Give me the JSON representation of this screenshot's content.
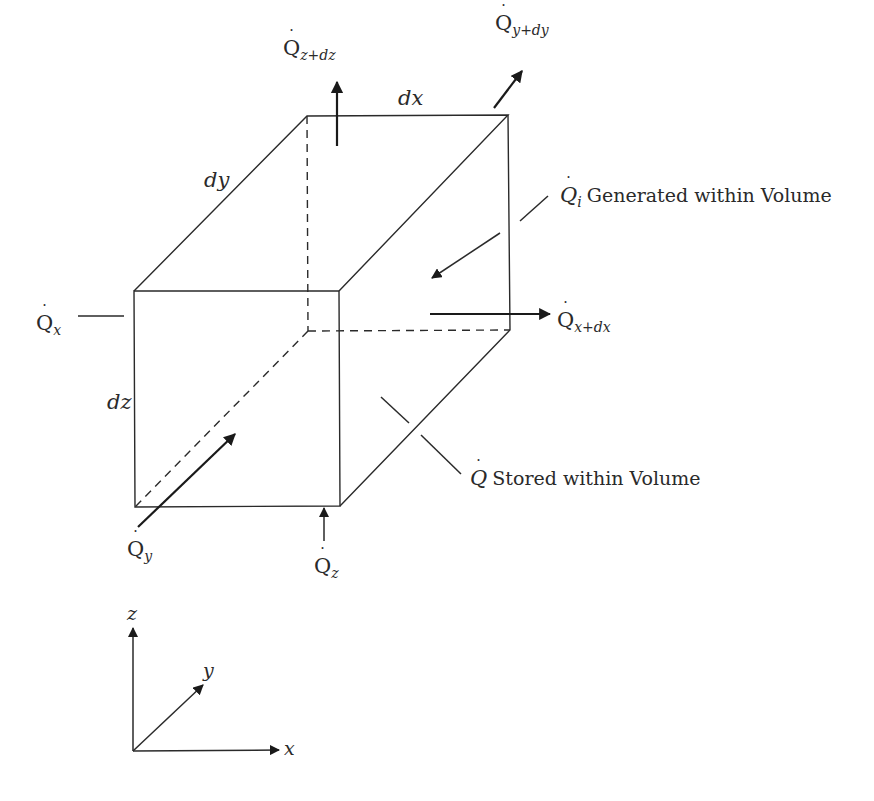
{
  "figure": {
    "type": "control-volume energy balance",
    "dimensions": {
      "dx": "dx",
      "dy": "dy",
      "dz": "dz"
    },
    "flows": {
      "qx": {
        "symbol": "Q",
        "sub": "x"
      },
      "qxdx": {
        "symbol": "Q",
        "sub": "x+dx"
      },
      "qy": {
        "symbol": "Q",
        "sub": "y"
      },
      "qydy": {
        "symbol": "Q",
        "sub": "y+dy"
      },
      "qz": {
        "symbol": "Q",
        "sub": "z"
      },
      "qzdz": {
        "symbol": "Q",
        "sub": "z+dz"
      },
      "qi": {
        "symbol": "Q",
        "sub": "i",
        "text": "Generated within Volume"
      },
      "qs": {
        "symbol": "Q",
        "text": "Stored within Volume"
      }
    },
    "axes": {
      "x": "x",
      "y": "y",
      "z": "z"
    },
    "dot": "˙",
    "colors": {
      "line": "#2a2a2a",
      "arrow": "#1a1a1a",
      "background": "#ffffff"
    }
  }
}
